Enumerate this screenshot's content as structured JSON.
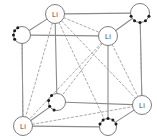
{
  "figure": {
    "width": 157,
    "height": 140,
    "background_color": "#ffffff"
  },
  "style": {
    "cell_edge_color": "#8a8a8a",
    "cell_edge_width": 1.1,
    "bond_solid_color": "#8a8a8a",
    "bond_dashed_color": "#9a9a9a",
    "dashed_pattern": "2.2 2.2",
    "atom_outline_color": "#7d7d7d",
    "atom_fill_color": "#ffffff",
    "atom_label_color": "#4a4a4a",
    "dot_color": "#1a1a1a"
  },
  "atoms": [
    {
      "id": "li-top-left",
      "element": "Li",
      "label": "Li",
      "type": "labelled",
      "cx": 55,
      "cy": 14,
      "r": 9.5,
      "dots": []
    },
    {
      "id": "dotted-top-right",
      "element": "",
      "label": "",
      "type": "dotted",
      "cx": 140,
      "cy": 13,
      "r": 9.5,
      "dots": [
        20,
        55,
        90,
        125,
        160
      ]
    },
    {
      "id": "dotted-upper-left",
      "element": "",
      "label": "",
      "type": "dotted",
      "cx": 22,
      "cy": 35,
      "r": 8.5,
      "dots": [
        150,
        180,
        210,
        240
      ]
    },
    {
      "id": "li-upper-right",
      "element": "Li",
      "label": "Li",
      "type": "labelled",
      "cx": 108,
      "cy": 36,
      "r": 9.5,
      "dots": []
    },
    {
      "id": "dotted-center-lower",
      "element": "",
      "label": "",
      "type": "dotted",
      "cx": 57,
      "cy": 102,
      "r": 8.5,
      "dots": [
        110,
        150,
        190,
        230
      ]
    },
    {
      "id": "li-lower-right",
      "element": "Li",
      "label": "Li",
      "type": "labelled",
      "cx": 142,
      "cy": 105,
      "r": 9.5,
      "dots": []
    },
    {
      "id": "li-bottom-left",
      "element": "Li",
      "label": "Li",
      "type": "labelled",
      "cx": 23,
      "cy": 126,
      "r": 9.5,
      "dots": []
    },
    {
      "id": "dotted-bottom-right",
      "element": "",
      "label": "",
      "type": "dotted",
      "cx": 108,
      "cy": 127,
      "r": 8.5,
      "dots": [
        200,
        235,
        270,
        305,
        340
      ]
    }
  ],
  "cell_edges": [
    {
      "from": "li-top-left",
      "to": "dotted-top-right"
    },
    {
      "from": "li-top-left",
      "to": "dotted-upper-left"
    },
    {
      "from": "li-top-left",
      "to": "dotted-center-lower"
    },
    {
      "from": "dotted-upper-left",
      "to": "li-upper-right"
    },
    {
      "from": "dotted-upper-left",
      "to": "li-bottom-left"
    },
    {
      "from": "dotted-top-right",
      "to": "li-upper-right"
    },
    {
      "from": "dotted-top-right",
      "to": "li-lower-right"
    },
    {
      "from": "li-upper-right",
      "to": "dotted-bottom-right"
    },
    {
      "from": "dotted-center-lower",
      "to": "li-lower-right"
    },
    {
      "from": "li-bottom-left",
      "to": "dotted-center-lower"
    },
    {
      "from": "li-bottom-left",
      "to": "dotted-bottom-right"
    },
    {
      "from": "dotted-bottom-right",
      "to": "li-lower-right"
    }
  ],
  "bonds_dashed": [
    {
      "from": "li-top-left",
      "to": "li-lower-right"
    },
    {
      "from": "li-top-left",
      "to": "li-bottom-left"
    },
    {
      "from": "li-top-left",
      "to": "dotted-bottom-right"
    },
    {
      "from": "li-top-left",
      "to": "li-upper-right"
    },
    {
      "from": "li-upper-right",
      "to": "li-bottom-left"
    },
    {
      "from": "li-upper-right",
      "to": "dotted-center-lower"
    },
    {
      "from": "li-upper-right",
      "to": "li-lower-right"
    },
    {
      "from": "li-bottom-left",
      "to": "li-lower-right"
    },
    {
      "from": "dotted-upper-left",
      "to": "li-bottom-left"
    },
    {
      "from": "dotted-top-right",
      "to": "li-lower-right"
    }
  ],
  "legend": {
    "li_label": "Li",
    "dotted_atom_description": "unlabelled atom"
  }
}
